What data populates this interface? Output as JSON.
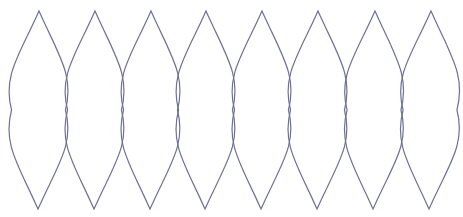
{
  "diagram": {
    "type": "repeated-lens-shapes",
    "count": 8,
    "stroke_color": "#6e7096",
    "background": "#ffffff",
    "lenses": [
      {
        "top": [
          39,
          11
        ],
        "bottom": [
          38,
          209
        ],
        "half_width": 27
      },
      {
        "top": [
          95,
          11
        ],
        "bottom": [
          94,
          209
        ],
        "half_width": 27
      },
      {
        "top": [
          151,
          11
        ],
        "bottom": [
          150,
          209
        ],
        "half_width": 27
      },
      {
        "top": [
          206,
          11
        ],
        "bottom": [
          205,
          209
        ],
        "half_width": 27
      },
      {
        "top": [
          262,
          11
        ],
        "bottom": [
          261,
          209
        ],
        "half_width": 27
      },
      {
        "top": [
          318,
          11
        ],
        "bottom": [
          317,
          209
        ],
        "half_width": 27
      },
      {
        "top": [
          375,
          11
        ],
        "bottom": [
          373,
          209
        ],
        "half_width": 27
      },
      {
        "top": [
          431,
          11
        ],
        "bottom": [
          429,
          209
        ],
        "half_width": 27
      }
    ]
  }
}
